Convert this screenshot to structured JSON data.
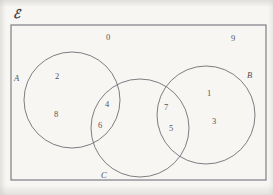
{
  "diagram": {
    "type": "venn",
    "title_symbol": "ℰ",
    "universal_set_label": "ℰ",
    "background_color": "#f7f6f3",
    "stroke_color": "#6e6e76",
    "text_color": "#55555c",
    "universe": {
      "name": "universal-set-rectangle",
      "x": 11,
      "y": 25,
      "width": 255,
      "height": 155
    },
    "sets": [
      {
        "id": "A",
        "label": "A",
        "cx": 72,
        "cy": 100,
        "r": 48,
        "label_x": 14,
        "label_y": 74
      },
      {
        "id": "B",
        "label": "B",
        "cx": 206,
        "cy": 115,
        "r": 49,
        "label_x": 247,
        "label_y": 71
      },
      {
        "id": "C",
        "label": "C",
        "cx": 140,
        "cy": 128,
        "r": 49,
        "label_x": 101,
        "label_y": 171
      }
    ],
    "elements": [
      {
        "value": "0",
        "region": "outside-all-sets",
        "x": 106,
        "y": 33
      },
      {
        "value": "9",
        "region": "outside-all-sets",
        "x": 231,
        "y": 34
      },
      {
        "value": "2",
        "region": "A-only",
        "x": 55,
        "y": 72
      },
      {
        "value": "8",
        "region": "A-only",
        "x": 54,
        "y": 110
      },
      {
        "value": "4",
        "region": "A-intersect-C",
        "x": 105,
        "y": 100
      },
      {
        "value": "6",
        "region": "A-intersect-C",
        "x": 98,
        "y": 121
      },
      {
        "value": "7",
        "region": "B-intersect-C",
        "x": 164,
        "y": 103
      },
      {
        "value": "5",
        "region": "B-intersect-C",
        "x": 169,
        "y": 124
      },
      {
        "value": "1",
        "region": "B-only",
        "x": 207,
        "y": 89
      },
      {
        "value": "3",
        "region": "B-only",
        "x": 212,
        "y": 117
      }
    ],
    "empty_regions": [
      "C-only",
      "A-intersect-B",
      "A-intersect-B-intersect-C"
    ]
  }
}
